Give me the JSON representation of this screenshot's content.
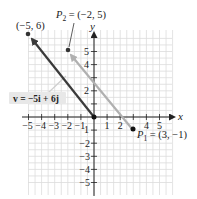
{
  "diagram": {
    "type": "coordinate-plane-vectors",
    "axes": {
      "x_label": "x",
      "y_label": "y",
      "x_range": [
        -5,
        5
      ],
      "y_range": [
        -5,
        6
      ],
      "x_ticks": [
        "-5",
        "-4",
        "-3",
        "-2",
        "-1",
        "1",
        "2",
        "4",
        "5"
      ],
      "y_ticks_pos": [
        "5",
        "4",
        "2"
      ],
      "y_ticks_neg": [
        "-1",
        "-2",
        "-3",
        "-4",
        "-5"
      ],
      "origin_label_x": "1",
      "origin_label_y": "1"
    },
    "points": {
      "p_neg5_6": {
        "label": "(−5, 6)",
        "x": -5,
        "y": 6
      },
      "p2": {
        "label_main": "P",
        "label_sub": "2",
        "label_rest": " = (−2, 5)",
        "x": -2,
        "y": 5
      },
      "p1": {
        "label_main": "P",
        "label_sub": "1",
        "label_rest": " = (3, −1)",
        "x": 3,
        "y": -1
      },
      "origin": {
        "x": 0,
        "y": 0
      }
    },
    "vectors": [
      {
        "name": "v-position",
        "from": [
          0,
          0
        ],
        "to": [
          -5,
          6
        ],
        "color": "#3a3a3a"
      },
      {
        "name": "p1-to-p2",
        "from": [
          3,
          -1
        ],
        "to": [
          -2,
          5
        ],
        "color": "#b0b0b0"
      }
    ],
    "vector_label": "v = −5i + 6j",
    "colors": {
      "grid": "#dcdcdc",
      "axis": "#222222",
      "dark_vector": "#3a3a3a",
      "light_vector": "#b0b0b0",
      "label_bg": "#e8e8e8"
    }
  }
}
